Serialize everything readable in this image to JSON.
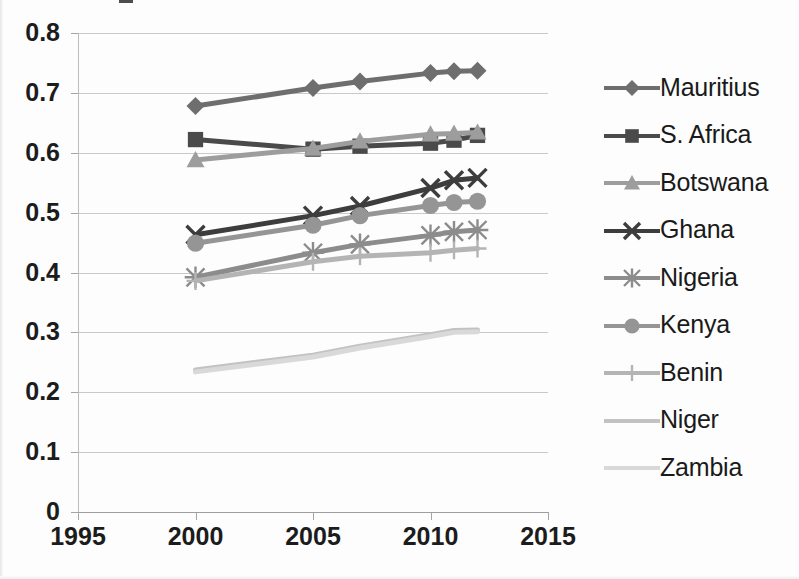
{
  "chart_data": {
    "type": "line",
    "title": "",
    "subtitle": "",
    "xlabel": "",
    "ylabel": "",
    "x": [
      2000,
      2005,
      2007,
      2010,
      2011,
      2012
    ],
    "xticks": [
      1995,
      2000,
      2005,
      2010,
      2015
    ],
    "yticks": [
      "0",
      "0.1",
      "0.2",
      "0.3",
      "0.4",
      "0.5",
      "0.6",
      "0.7",
      "0.8"
    ],
    "xlim": [
      1995,
      2015
    ],
    "ylim": [
      0,
      0.8
    ],
    "grid": true,
    "legend_position": "right",
    "series": [
      {
        "name": "Mauritius",
        "marker": "diamond",
        "color": "#6e6e6e",
        "x": [
          2000,
          2005,
          2007,
          2010,
          2011,
          2012
        ],
        "values": [
          0.678,
          0.708,
          0.719,
          0.733,
          0.736,
          0.737
        ]
      },
      {
        "name": "S. Africa",
        "marker": "square",
        "color": "#4a4a4a",
        "x": [
          2000,
          2005,
          2007,
          2010,
          2011,
          2012
        ],
        "values": [
          0.622,
          0.606,
          0.611,
          0.616,
          0.621,
          0.629
        ]
      },
      {
        "name": "Botswana",
        "marker": "triangle",
        "color": "#9d9d9d",
        "x": [
          2000,
          2005,
          2007,
          2010,
          2011,
          2012
        ],
        "values": [
          0.588,
          0.607,
          0.619,
          0.631,
          0.632,
          0.634
        ]
      },
      {
        "name": "Ghana",
        "marker": "cross",
        "color": "#3d3d3d",
        "x": [
          2000,
          2005,
          2007,
          2010,
          2011,
          2012
        ],
        "values": [
          0.463,
          0.495,
          0.511,
          0.541,
          0.554,
          0.558
        ]
      },
      {
        "name": "Nigeria",
        "marker": "asterisk",
        "color": "#8c8c8c",
        "x": [
          2000,
          2005,
          2007,
          2010,
          2011,
          2012
        ],
        "values": [
          0.392,
          0.433,
          0.447,
          0.462,
          0.468,
          0.471
        ]
      },
      {
        "name": "Kenya",
        "marker": "circle",
        "color": "#959595",
        "x": [
          2000,
          2005,
          2007,
          2010,
          2011,
          2012
        ],
        "values": [
          0.449,
          0.479,
          0.495,
          0.512,
          0.517,
          0.519
        ]
      },
      {
        "name": "Benin",
        "marker": "plus",
        "color": "#b4b4b4",
        "x": [
          2000,
          2005,
          2007,
          2010,
          2011,
          2012
        ],
        "values": [
          0.386,
          0.418,
          0.427,
          0.433,
          0.437,
          0.44
        ]
      },
      {
        "name": "Niger",
        "marker": "line",
        "color": "#c2c2c2",
        "x": [
          2000,
          2005,
          2007,
          2010,
          2011,
          2012
        ],
        "values": [
          0.237,
          0.262,
          0.277,
          0.296,
          0.303,
          0.304
        ]
      },
      {
        "name": "Zambia",
        "marker": "line",
        "color": "#d9d9d9",
        "x": [
          2000,
          2005,
          2007,
          2010,
          2011,
          2012
        ],
        "values": [
          0.234,
          0.259,
          0.274,
          0.293,
          0.3,
          0.301
        ]
      }
    ]
  },
  "legend": {
    "items": [
      {
        "label": "Mauritius"
      },
      {
        "label": "S. Africa"
      },
      {
        "label": "Botswana"
      },
      {
        "label": "Ghana"
      },
      {
        "label": "Nigeria"
      },
      {
        "label": "Kenya"
      },
      {
        "label": "Benin"
      },
      {
        "label": "Niger"
      },
      {
        "label": "Zambia"
      }
    ]
  },
  "colors": {
    "gridline": "#c9c9c9",
    "axis": "#9e9e9e",
    "text": "#1c1c1c",
    "background": "#fdfdfd"
  }
}
